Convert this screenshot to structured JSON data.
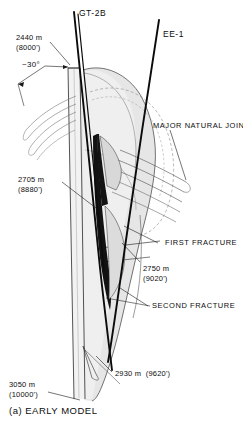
{
  "figure": {
    "caption": "(a) EARLY MODEL",
    "caption_label": "(a)",
    "caption_title": "EARLY MODEL"
  },
  "wells": [
    {
      "name": "GT-2B",
      "id": "well-gt-2b"
    },
    {
      "name": "EE-1",
      "id": "well-ee-1"
    }
  ],
  "annotations": {
    "angle": "~30°",
    "major_natural_joints": "MAJOR NATURAL JOINTS",
    "first_fracture": "FIRST FRACTURE",
    "second_fracture": "SECOND FRACTURE"
  },
  "depths": [
    {
      "id": "depth-2440",
      "metric": "2440 m",
      "imperial": "(8000')"
    },
    {
      "id": "depth-2705",
      "metric": "2705 m",
      "imperial": "(8880')"
    },
    {
      "id": "depth-2750",
      "metric": "2750 m",
      "imperial": "(9020')"
    },
    {
      "id": "depth-2930",
      "metric": "2930 m  (9620')",
      "imperial": ""
    },
    {
      "id": "depth-3050",
      "metric": "3050 m",
      "imperial": "(10000')"
    }
  ],
  "colors": {
    "ink": "#0d0d0d",
    "line": "#1a1a1a",
    "reservoir_fill": "#e3e3e3",
    "reservoir_fill_light": "#eeeeee",
    "fracture_dark": "#151515",
    "joint_stroke": "#5a5a5a",
    "background": "#ffffff"
  }
}
